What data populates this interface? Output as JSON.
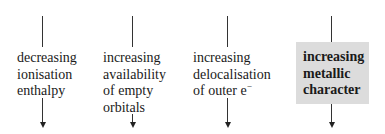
{
  "diagram": {
    "columns": [
      {
        "lines": [
          "decreasing",
          "ionisation",
          "enthalpy"
        ],
        "highlighted": false
      },
      {
        "lines": [
          "increasing",
          "availability",
          "of empty",
          "orbitals"
        ],
        "highlighted": false
      },
      {
        "lines": [
          "increasing",
          "delocalisation",
          "of outer e"
        ],
        "superscript": "−",
        "highlighted": false
      },
      {
        "lines": [
          "increasing",
          "metallic",
          "character"
        ],
        "highlighted": true
      }
    ],
    "colors": {
      "box": "#dcdcdc",
      "line": "#333333",
      "text": "#1a1a1a"
    }
  }
}
